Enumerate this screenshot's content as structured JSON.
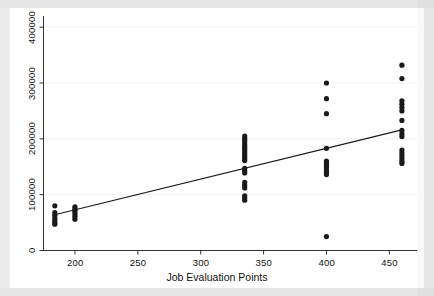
{
  "figure": {
    "background_color": "#ebebeb",
    "plot_background_color": "#ffffff",
    "axis_color": "#222222",
    "marker_color": "#1a1a1a",
    "line_color": "#1a1a1a",
    "grid_color": "#f2f2f2"
  },
  "chart_data": {
    "type": "scatter",
    "title": "",
    "subtitle": "",
    "xlabel": "Job Evaluation Points",
    "ylabel": "",
    "xlim": [
      175,
      472
    ],
    "ylim": [
      0,
      420000
    ],
    "xticks": [
      200,
      250,
      300,
      350,
      400,
      450
    ],
    "xtick_labels": [
      "200",
      "250",
      "300",
      "350",
      "400",
      "450"
    ],
    "yticks": [
      0,
      100000,
      200000,
      300000,
      400000
    ],
    "ytick_labels": [
      "0",
      "100000",
      "200000",
      "300000",
      "400000"
    ],
    "grid": true,
    "grid_axis": "y",
    "legend": "none",
    "annotations": [],
    "series": [
      {
        "name": "observations",
        "type": "scatter",
        "marker": "filled-circle",
        "marker_size": 4,
        "points": [
          [
            184,
            80000
          ],
          [
            184,
            68000
          ],
          [
            184,
            63000
          ],
          [
            184,
            58000
          ],
          [
            184,
            54000
          ],
          [
            184,
            50000
          ],
          [
            184,
            47000
          ],
          [
            200,
            78000
          ],
          [
            200,
            74000
          ],
          [
            200,
            71000
          ],
          [
            200,
            68000
          ],
          [
            200,
            64000
          ],
          [
            200,
            60000
          ],
          [
            200,
            56000
          ],
          [
            335,
            205000
          ],
          [
            335,
            201000
          ],
          [
            335,
            197000
          ],
          [
            335,
            193000
          ],
          [
            335,
            189000
          ],
          [
            335,
            185000
          ],
          [
            335,
            181000
          ],
          [
            335,
            177000
          ],
          [
            335,
            173000
          ],
          [
            335,
            169000
          ],
          [
            335,
            165000
          ],
          [
            335,
            161000
          ],
          [
            335,
            147000
          ],
          [
            335,
            143000
          ],
          [
            335,
            139000
          ],
          [
            335,
            122000
          ],
          [
            335,
            117000
          ],
          [
            335,
            112000
          ],
          [
            335,
            98000
          ],
          [
            335,
            94000
          ],
          [
            335,
            90000
          ],
          [
            400,
            300000
          ],
          [
            400,
            272000
          ],
          [
            400,
            245000
          ],
          [
            400,
            183000
          ],
          [
            400,
            160000
          ],
          [
            400,
            156000
          ],
          [
            400,
            152000
          ],
          [
            400,
            148000
          ],
          [
            400,
            144000
          ],
          [
            400,
            140000
          ],
          [
            400,
            136000
          ],
          [
            400,
            25000
          ],
          [
            460,
            332000
          ],
          [
            460,
            308000
          ],
          [
            460,
            268000
          ],
          [
            460,
            262000
          ],
          [
            460,
            256000
          ],
          [
            460,
            250000
          ],
          [
            460,
            233000
          ],
          [
            460,
            215000
          ],
          [
            460,
            209000
          ],
          [
            460,
            204000
          ],
          [
            460,
            180000
          ],
          [
            460,
            175000
          ],
          [
            460,
            170000
          ],
          [
            460,
            165000
          ],
          [
            460,
            160000
          ],
          [
            460,
            156000
          ]
        ]
      },
      {
        "name": "fitted-line",
        "type": "line",
        "points": [
          [
            184,
            64000
          ],
          [
            460,
            216000
          ]
        ]
      }
    ]
  }
}
